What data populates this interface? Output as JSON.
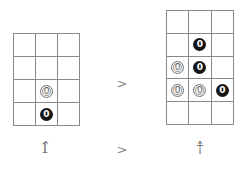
{
  "diagram": {
    "left_board": {
      "rows": 4,
      "cols": 3,
      "cells": [
        [
          "",
          "",
          ""
        ],
        [
          "",
          "",
          ""
        ],
        [
          "",
          "W",
          ""
        ],
        [
          "",
          "B",
          ""
        ]
      ],
      "stone_text": "0"
    },
    "right_board": {
      "rows": 5,
      "cols": 3,
      "cells": [
        [
          "",
          "",
          ""
        ],
        [
          "",
          "B",
          ""
        ],
        [
          "W",
          "B",
          ""
        ],
        [
          "W",
          "W",
          "B"
        ],
        [
          "",
          "",
          ""
        ]
      ],
      "stone_text": "0"
    },
    "comparison_top": ">",
    "comparison_bottom": ">",
    "left_label": "1̂",
    "right_label": "†̂",
    "colors": {
      "grid_line": "#8a8a8a",
      "black_stone": "#151515",
      "white_stone": "#ffffff",
      "text": "#777777"
    }
  }
}
